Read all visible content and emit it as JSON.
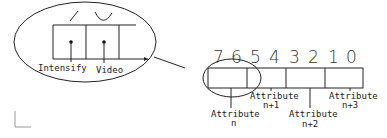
{
  "diagram": {
    "type": "attribute-byte-layout",
    "zoomed_view": {
      "labels": [
        "Intensify",
        "Video"
      ]
    },
    "bit_numbers": [
      "7",
      "6",
      "5",
      "4",
      "3",
      "2",
      "1",
      "0"
    ],
    "fields": [
      {
        "label": "Attribute",
        "sub": "n"
      },
      {
        "label": "Attribute",
        "sub": "n+1"
      },
      {
        "label": "Attribute",
        "sub": "n+2"
      },
      {
        "label": "Attribute",
        "sub": "n+3"
      }
    ],
    "colors": {
      "stroke": "#222222",
      "background": "#ffffff",
      "corner_mark": "#999999"
    }
  }
}
